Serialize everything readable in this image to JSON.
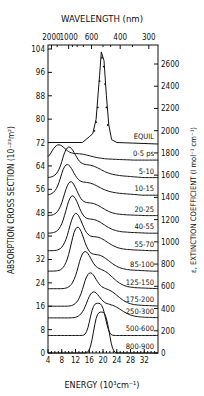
{
  "chart_data": {
    "type": "line",
    "title": "",
    "top_xlabel": "WAVELENGTH (nm)",
    "top_xticks": [
      "2000",
      "1000",
      "600",
      "400",
      "300"
    ],
    "xlabel": "ENERGY (10³cm⁻¹)",
    "xticks": [
      "4",
      "8",
      "12",
      "16",
      "20",
      "24",
      "28",
      "32"
    ],
    "xlim": [
      4,
      36
    ],
    "ylabel": "ABSORPTION CROSS SECTION (10⁻²³m²)",
    "yticks": [
      "0",
      "8",
      "16",
      "24",
      "32",
      "40",
      "48",
      "56",
      "64",
      "72",
      "80",
      "88",
      "96",
      "104"
    ],
    "ylim": [
      0,
      104
    ],
    "y2label": "ε, EXTINCTION COEFFICIENT (l mol⁻¹ cm⁻¹)",
    "y2ticks": [
      "0",
      "200",
      "400",
      "600",
      "800",
      "1000",
      "1200",
      "1400",
      "1600",
      "1800",
      "2000",
      "2200",
      "2400",
      "2600"
    ],
    "grid": false,
    "series": [
      {
        "name": "EQUIL",
        "offset": 72,
        "peak_energy": 19.5,
        "peak_value": 103,
        "points": [
          [
            4,
            72
          ],
          [
            14,
            72
          ],
          [
            16,
            74
          ],
          [
            17,
            75
          ],
          [
            18,
            80
          ],
          [
            19,
            95
          ],
          [
            19.5,
            103
          ],
          [
            20.3,
            100
          ],
          [
            21,
            88
          ],
          [
            21.7,
            78
          ],
          [
            22.5,
            73
          ],
          [
            24,
            72
          ],
          [
            36,
            71.5
          ]
        ]
      },
      {
        "name": "0-5 ps",
        "offset": 66,
        "peak_energy": 7,
        "peak_value": 70
      },
      {
        "name": "5-10",
        "offset": 60,
        "peak_energy": 10,
        "peak_value": 68
      },
      {
        "name": "10-15",
        "offset": 54,
        "peak_energy": 9.5,
        "peak_value": 62
      },
      {
        "name": "20-25",
        "offset": 47,
        "peak_energy": 10.5,
        "peak_value": 57
      },
      {
        "name": "40-55",
        "offset": 41,
        "peak_energy": 11,
        "peak_value": 52
      },
      {
        "name": "55-70",
        "offset": 35,
        "peak_energy": 12,
        "peak_value": 46
      },
      {
        "name": "85-100",
        "offset": 28,
        "peak_energy": 12.5,
        "peak_value": 41
      },
      {
        "name": "125-150",
        "offset": 22,
        "peak_energy": 14.5,
        "peak_value": 32
      },
      {
        "name": "175-200",
        "offset": 16,
        "peak_energy": 16,
        "peak_value": 25
      },
      {
        "name": "250-300",
        "offset": 12,
        "peak_energy": 17,
        "peak_value": 19
      },
      {
        "name": "500-600",
        "offset": 6,
        "peak_energy": 18.5,
        "peak_value": 17
      },
      {
        "name": "800-900",
        "offset": 0,
        "peak_energy": 19.5,
        "peak_value": 14
      }
    ]
  }
}
